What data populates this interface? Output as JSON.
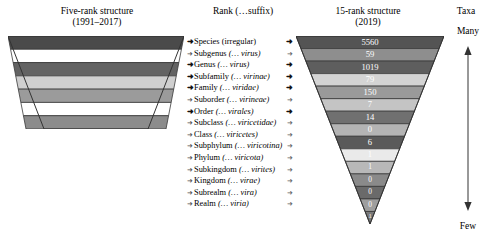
{
  "headers": {
    "left_line1": "Five-rank structure",
    "left_line2": "(1991–2017)",
    "middle": "Rank (…suffix)",
    "right_line1": "15-rank structure",
    "right_line2": "(2019)",
    "taxa": "Taxa"
  },
  "axis": {
    "top_label": "Many",
    "bottom_label": "Few",
    "arrow_icon": "double-headed-vertical-arrow"
  },
  "marker_icon": "small-arrow-marker",
  "ranks": [
    {
      "name": "Species",
      "suffix": "(irregular)",
      "suffix_italic": false,
      "primary": true,
      "right_marker": true
    },
    {
      "name": "Subgenus",
      "suffix": "(… virus)",
      "suffix_italic": true,
      "primary": false,
      "right_marker": false
    },
    {
      "name": "Genus",
      "suffix": "(… virus)",
      "suffix_italic": true,
      "primary": true,
      "right_marker": true
    },
    {
      "name": "Subfamily",
      "suffix": "(… virinae)",
      "suffix_italic": true,
      "primary": true,
      "right_marker": true
    },
    {
      "name": "Family",
      "suffix": "(… viridae)",
      "suffix_italic": true,
      "primary": true,
      "right_marker": true
    },
    {
      "name": "Suborder",
      "suffix": "(… virineae)",
      "suffix_italic": true,
      "primary": false,
      "right_marker": false
    },
    {
      "name": "Order",
      "suffix": "(… virales)",
      "suffix_italic": true,
      "primary": true,
      "right_marker": true
    },
    {
      "name": "Subclass",
      "suffix": "(… viricetidae)",
      "suffix_italic": true,
      "primary": false,
      "right_marker": false
    },
    {
      "name": "Class",
      "suffix": "(… viricetes)",
      "suffix_italic": true,
      "primary": false,
      "right_marker": false
    },
    {
      "name": "Subphylum",
      "suffix": "(… viricotina)",
      "suffix_italic": true,
      "primary": false,
      "right_marker": false
    },
    {
      "name": "Phylum",
      "suffix": "(… viricota)",
      "suffix_italic": true,
      "primary": false,
      "right_marker": false
    },
    {
      "name": "Subkingdom",
      "suffix": "(… virites)",
      "suffix_italic": true,
      "primary": false,
      "right_marker": false
    },
    {
      "name": "Kingdom",
      "suffix": "(… virae)",
      "suffix_italic": true,
      "primary": false,
      "right_marker": false
    },
    {
      "name": "Subrealm",
      "suffix": "(… vira)",
      "suffix_italic": true,
      "primary": false,
      "right_marker": false
    },
    {
      "name": "Realm",
      "suffix": "(… viria)",
      "suffix_italic": true,
      "primary": false,
      "right_marker": false
    }
  ],
  "chart_data": {
    "type": "bar",
    "title": "15-rank structure (2019)",
    "xlabel": "",
    "ylabel": "Taxa",
    "orientation": "inverted-triangle-stack",
    "categories": [
      "Species",
      "Subgenus",
      "Genus",
      "Subfamily",
      "Family",
      "Suborder",
      "Order",
      "Subclass",
      "Class",
      "Subphylum",
      "Phylum",
      "Subkingdom",
      "Kingdom",
      "Subrealm",
      "Realm"
    ],
    "values": [
      5560,
      59,
      1019,
      79,
      150,
      7,
      14,
      0,
      6,
      1,
      1,
      0,
      0,
      0,
      1
    ],
    "band_fills": [
      "#545454",
      "#8e8e8e",
      "#5e5e5e",
      "#d4d4d4",
      "#9a9a9a",
      "#c4c4c4",
      "#707070",
      "#b4b4b4",
      "#5a5a5a",
      "#eaeaea",
      "#b8b8b8",
      "#8a8a8a",
      "#6a6a6a",
      "#9e9e9e",
      "#7a7a7a"
    ],
    "left_structure": {
      "title": "Five-rank structure (1991–2017)",
      "bands": [
        {
          "fill": "#4a4a4a"
        },
        {
          "fill": "#ffffff"
        },
        {
          "fill": "#636363"
        },
        {
          "fill": "#cfcfcf"
        },
        {
          "fill": "#9b9b9b"
        },
        {
          "fill": "#ffffff"
        },
        {
          "fill": "#8c8c8c"
        }
      ]
    },
    "legend_position": "none",
    "grid": false
  }
}
